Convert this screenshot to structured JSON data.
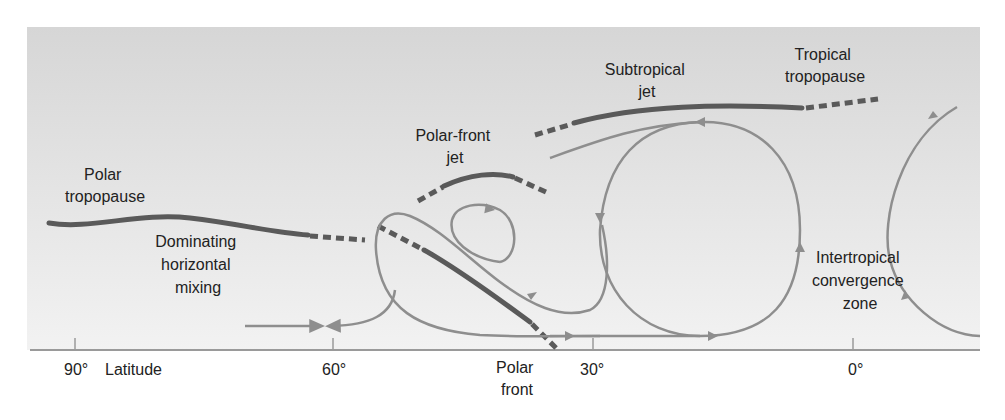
{
  "diagram": {
    "type": "atmospheric-circulation-cross-section",
    "colors": {
      "panel_top": "#d6d6d6",
      "panel_bottom": "#f2f2f2",
      "tropopause": "#5a5a5a",
      "flow_lines": "#8e8e8e",
      "axis": "#9a9a9a",
      "text": "#222222"
    },
    "labels": {
      "polar_tropopause": [
        "Polar",
        "tropopause"
      ],
      "polar_front_jet": [
        "Polar-front",
        "jet"
      ],
      "subtropical_jet": [
        "Subtropical",
        "jet"
      ],
      "tropical_tropopause": [
        "Tropical",
        "tropopause"
      ],
      "dominating_mixing": [
        "Dominating",
        "horizontal",
        "mixing"
      ],
      "itcz": [
        "Intertropical",
        "convergence",
        "zone"
      ],
      "polar_front": [
        "Polar",
        "front"
      ]
    },
    "axis": {
      "ticks": [
        {
          "label": "90°",
          "x": 75
        },
        {
          "label": "60°",
          "x": 333
        },
        {
          "label": "30°",
          "x": 593
        },
        {
          "label": "0°",
          "x": 853
        }
      ],
      "axis_title": "Latitude"
    }
  }
}
